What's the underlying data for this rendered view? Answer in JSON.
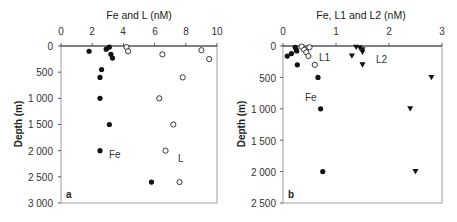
{
  "chart_data": [
    {
      "type": "scatter",
      "panel_label": "a",
      "title": "Fe and L (nM)",
      "xlabel": "Fe and L (nM)",
      "ylabel": "Depth (m)",
      "xlim": [
        0,
        10
      ],
      "ylim": [
        3000,
        0
      ],
      "x_ticks": [
        "0",
        "2",
        "4",
        "6",
        "8",
        "10"
      ],
      "y_ticks": [
        "0",
        "500",
        "1 000",
        "1 500",
        "2 000",
        "2 500",
        "3 000"
      ],
      "x_axis_position": "top",
      "y_inverted": true,
      "grid": false,
      "annotations": [
        {
          "text": "Fe",
          "x": 3.1,
          "depth": 2050
        },
        {
          "text": "L",
          "x": 7.6,
          "depth": 2150
        },
        {
          "text": "a",
          "x": 0.5,
          "depth": 2850
        }
      ],
      "series": [
        {
          "name": "Fe",
          "marker": "filled-circle",
          "points": [
            {
              "x": 3.1,
              "depth": 20
            },
            {
              "x": 2.9,
              "depth": 60
            },
            {
              "x": 1.8,
              "depth": 100
            },
            {
              "x": 3.2,
              "depth": 160
            },
            {
              "x": 3.3,
              "depth": 230
            },
            {
              "x": 2.6,
              "depth": 450
            },
            {
              "x": 2.5,
              "depth": 600
            },
            {
              "x": 2.5,
              "depth": 1000
            },
            {
              "x": 3.1,
              "depth": 1500
            },
            {
              "x": 2.5,
              "depth": 2000
            },
            {
              "x": 5.8,
              "depth": 2600
            }
          ]
        },
        {
          "name": "L",
          "marker": "open-circle",
          "points": [
            {
              "x": 4.2,
              "depth": 20
            },
            {
              "x": 4.3,
              "depth": 100
            },
            {
              "x": 9.0,
              "depth": 80
            },
            {
              "x": 6.5,
              "depth": 160
            },
            {
              "x": 9.5,
              "depth": 250
            },
            {
              "x": 7.8,
              "depth": 600
            },
            {
              "x": 6.3,
              "depth": 1000
            },
            {
              "x": 7.2,
              "depth": 1500
            },
            {
              "x": 6.7,
              "depth": 2000
            },
            {
              "x": 7.6,
              "depth": 2600
            }
          ]
        }
      ]
    },
    {
      "type": "scatter",
      "panel_label": "b",
      "title": "Fe, L1 and L2 (nM)",
      "xlabel": "Fe, L1 and L2 (nM)",
      "ylabel": "Depth (m)",
      "xlim": [
        0,
        3
      ],
      "ylim": [
        2500,
        0
      ],
      "x_ticks": [
        "0",
        "1",
        "2",
        "3"
      ],
      "y_ticks": [
        "0",
        "500",
        "1 000",
        "1 500",
        "2 000",
        "2 500"
      ],
      "x_axis_position": "top",
      "y_inverted": true,
      "grid": false,
      "annotations": [
        {
          "text": "L1",
          "x": 0.68,
          "depth": 160
        },
        {
          "text": "L2",
          "x": 1.7,
          "depth": 200
        },
        {
          "text": "Fe",
          "x": 0.45,
          "depth": 800
        },
        {
          "text": "b",
          "x": 0.12,
          "depth": 2370
        }
      ],
      "series": [
        {
          "name": "Fe",
          "marker": "filled-circle",
          "points": [
            {
              "x": 0.23,
              "depth": 20
            },
            {
              "x": 0.25,
              "depth": 60
            },
            {
              "x": 0.26,
              "depth": 80
            },
            {
              "x": 0.16,
              "depth": 120
            },
            {
              "x": 0.08,
              "depth": 160
            },
            {
              "x": 0.27,
              "depth": 300
            },
            {
              "x": 0.66,
              "depth": 500
            },
            {
              "x": 0.71,
              "depth": 1000
            },
            {
              "x": 0.75,
              "depth": 2000
            }
          ]
        },
        {
          "name": "L1",
          "marker": "open-circle",
          "points": [
            {
              "x": 0.35,
              "depth": 10
            },
            {
              "x": 0.5,
              "depth": 20
            },
            {
              "x": 0.4,
              "depth": 60
            },
            {
              "x": 0.44,
              "depth": 100
            },
            {
              "x": 0.48,
              "depth": 160
            },
            {
              "x": 0.6,
              "depth": 300
            }
          ]
        },
        {
          "name": "L2",
          "marker": "filled-triangle-down",
          "points": [
            {
              "x": 1.38,
              "depth": 20
            },
            {
              "x": 1.45,
              "depth": 30
            },
            {
              "x": 1.5,
              "depth": 60
            },
            {
              "x": 1.5,
              "depth": 100
            },
            {
              "x": 1.3,
              "depth": 160
            },
            {
              "x": 1.5,
              "depth": 300
            },
            {
              "x": 2.8,
              "depth": 500
            },
            {
              "x": 2.4,
              "depth": 1000
            },
            {
              "x": 2.5,
              "depth": 2000
            }
          ]
        }
      ]
    }
  ],
  "panels": [
    {
      "title": "Fe and L (nM)",
      "ylabel": "Depth (m)",
      "label": "a",
      "x_ticks": [
        "0",
        "2",
        "4",
        "6",
        "8",
        "10"
      ],
      "y_ticks": [
        "0",
        "500",
        "1 000",
        "1 500",
        "2 000",
        "2 500",
        "3 000"
      ],
      "annotations": [
        "Fe",
        "L"
      ]
    },
    {
      "title": "Fe, L1 and L2 (nM)",
      "ylabel": "Depth (m)",
      "label": "b",
      "x_ticks": [
        "0",
        "1",
        "2",
        "3"
      ],
      "y_ticks": [
        "0",
        "500",
        "1 000",
        "1 500",
        "2 000",
        "2 500"
      ],
      "annotations": [
        "L1",
        "L2",
        "Fe"
      ]
    }
  ]
}
